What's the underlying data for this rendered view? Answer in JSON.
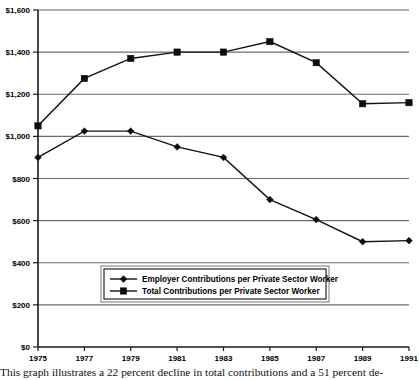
{
  "chart_data": {
    "type": "line",
    "title": "",
    "subtitle": "",
    "xlabel": "",
    "ylabel": "",
    "grid": true,
    "legend_position": "bottom-center",
    "x": [
      1975,
      1977,
      1979,
      1981,
      1983,
      1985,
      1987,
      1989,
      1991
    ],
    "xtick_labels": [
      "1975",
      "1977",
      "1979",
      "1981",
      "1983",
      "1985",
      "1987",
      "1989",
      "1991"
    ],
    "ytick_labels": [
      "$0",
      "$200",
      "$400",
      "$600",
      "$800",
      "$1,000",
      "$1,200",
      "$1,400",
      "$1,600"
    ],
    "ytick_values": [
      0,
      200,
      400,
      600,
      800,
      1000,
      1200,
      1400,
      1600
    ],
    "xlim": [
      1975,
      1991
    ],
    "ylim": [
      0,
      1600
    ],
    "series": [
      {
        "name": "Employer Contributions per Private Sector Worker",
        "marker": "diamond",
        "values": [
          900,
          1025,
          1025,
          950,
          900,
          700,
          605,
          500,
          505
        ]
      },
      {
        "name": "Total Contributions per Private Sector Worker",
        "marker": "square",
        "values": [
          1050,
          1275,
          1370,
          1400,
          1400,
          1450,
          1350,
          1155,
          1160
        ]
      }
    ]
  },
  "legend": {
    "entries": [
      {
        "label": "Employer Contributions per Private Sector Worker",
        "marker": "diamond"
      },
      {
        "label": "Total Contributions per Private Sector Worker",
        "marker": "square"
      }
    ]
  },
  "caption": {
    "text": "This graph illustrates a 22 percent decline in total contributions and a 51 percent de-"
  },
  "colors": {
    "line": "#111111",
    "grid": "#6b6b6b",
    "axis": "#1a1a1a",
    "background": "#ffffff"
  }
}
